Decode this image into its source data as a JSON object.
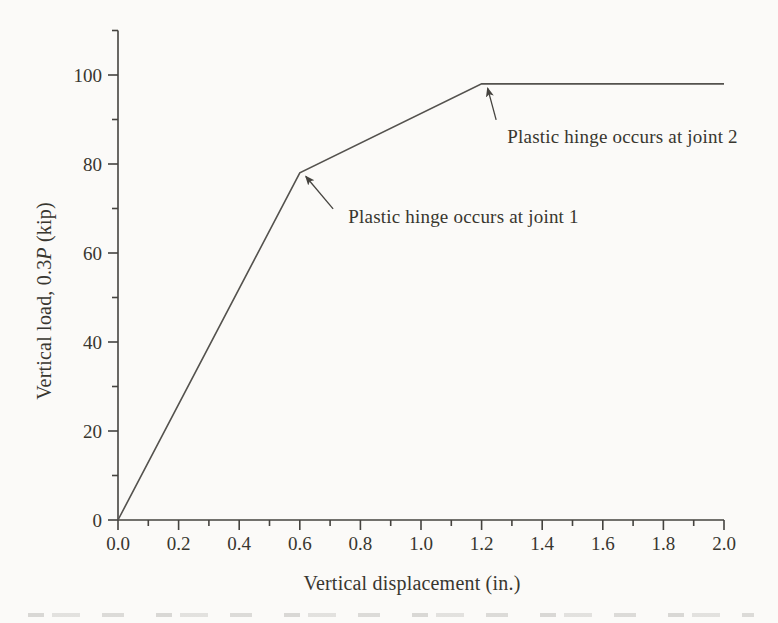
{
  "figure": {
    "background_color": "#fbfaf8",
    "ink_color": "#45433f",
    "curve_color": "#54524e",
    "text_color": "#38362f"
  },
  "chart_data": {
    "type": "line",
    "title": "",
    "xlabel": "Vertical displacement (in.)",
    "ylabel": "Vertical load, 0.3P (kip)",
    "ylabel_parts": {
      "prefix": "Vertical load, 0.3",
      "italic": "P",
      "suffix": " (kip)"
    },
    "xlim": [
      0.0,
      2.0
    ],
    "ylim": [
      0,
      110
    ],
    "grid": false,
    "legend": null,
    "x_major_ticks": [
      0.0,
      0.2,
      0.4,
      0.6,
      0.8,
      1.0,
      1.2,
      1.4,
      1.6,
      1.8,
      2.0
    ],
    "x_tick_labels": [
      "0.0",
      "0.2",
      "0.4",
      "0.6",
      "0.8",
      "1.0",
      "1.2",
      "1.4",
      "1.6",
      "1.8",
      "2.0"
    ],
    "x_minor_ticks": [
      0.1,
      0.3,
      0.5,
      0.7,
      0.9,
      1.1,
      1.3,
      1.5,
      1.7,
      1.9
    ],
    "y_major_ticks": [
      0,
      20,
      40,
      60,
      80,
      100
    ],
    "y_tick_labels": [
      "0",
      "20",
      "40",
      "60",
      "80",
      "100"
    ],
    "y_minor_ticks": [
      10,
      30,
      50,
      70,
      90,
      110
    ],
    "series": [
      {
        "name": "load-displacement-curve",
        "points": [
          [
            0.0,
            0
          ],
          [
            0.6,
            78
          ],
          [
            1.2,
            98
          ],
          [
            2.0,
            98
          ]
        ]
      }
    ],
    "annotations": [
      {
        "label": "Plastic hinge occurs at joint 1",
        "text_x": 0.76,
        "text_y": 68.3,
        "arrow_from": [
          0.71,
          69.9
        ],
        "arrow_to": [
          0.62,
          77.2
        ]
      },
      {
        "label": "Plastic hinge occurs at joint 2",
        "text_x": 1.285,
        "text_y": 86.1,
        "arrow_from": [
          1.248,
          89.9
        ],
        "arrow_to": [
          1.22,
          97.0
        ]
      }
    ]
  }
}
